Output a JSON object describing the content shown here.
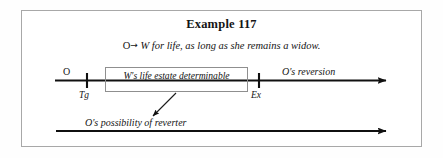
{
  "figure": {
    "title": "Example 117",
    "conveyance": {
      "grantor": "O",
      "arrow": "→",
      "text": "W for life, as long as she remains a widow."
    },
    "timeline_main": {
      "start_label": "O",
      "tick_labels": [
        "Tg",
        "Ex"
      ],
      "estate_box_label": "W's life estate determinable",
      "future_interest_label": "O's reversion"
    },
    "timeline_bottom": {
      "label": "O's possibility of reverter"
    },
    "colors": {
      "ink": "#141414",
      "frame": "#a8a8a8",
      "box_border": "#8f8f8f",
      "background": "#ffffff"
    }
  }
}
